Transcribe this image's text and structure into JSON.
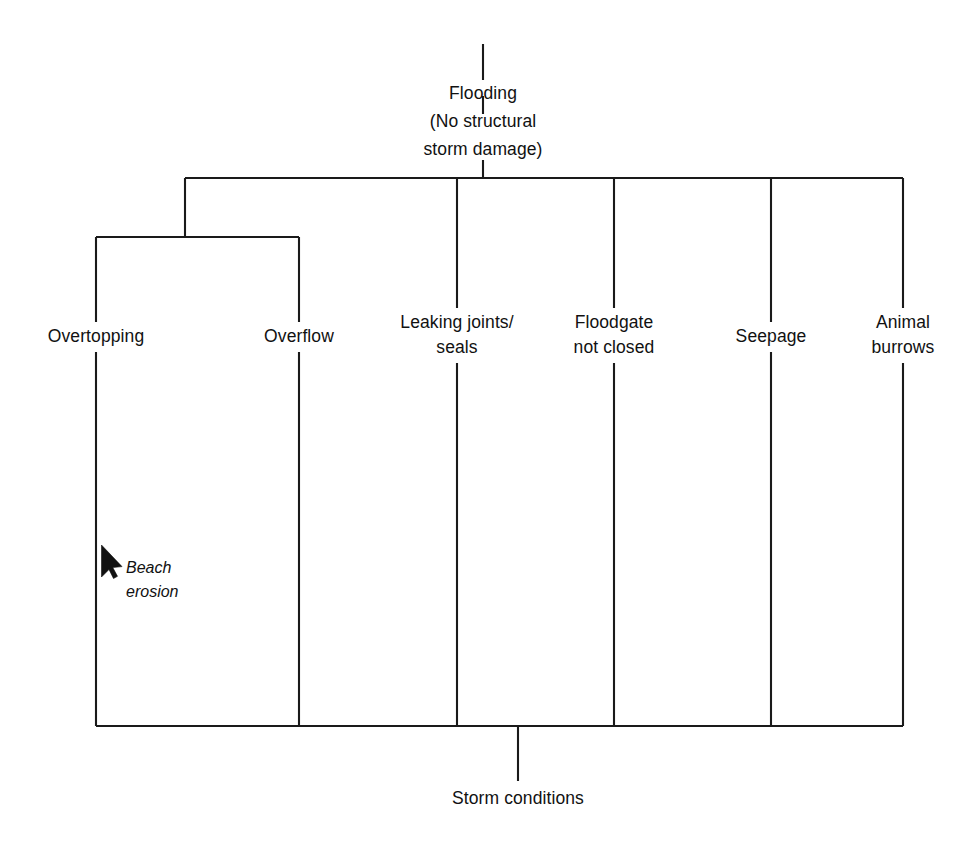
{
  "diagram": {
    "type": "fault-tree",
    "background_color": "#ffffff",
    "line_color": "#1a1a1a",
    "text_color": "#111111",
    "top_event": {
      "name": "flooding",
      "label": "Flooding\n(No structural\nstorm damage)"
    },
    "basic_event": {
      "name": "storm-conditions",
      "label": "Storm conditions"
    },
    "intermediate_events": [
      {
        "name": "overtopping",
        "label": "Overtopping"
      },
      {
        "name": "overflow",
        "label": "Overflow"
      },
      {
        "name": "leaking-joints-seals",
        "label": "Leaking joints/\nseals"
      },
      {
        "name": "floodgate-not-closed",
        "label": "Floodgate\nnot closed"
      },
      {
        "name": "seepage",
        "label": "Seepage"
      },
      {
        "name": "animal-burrows",
        "label": "Animal\nburrows"
      }
    ],
    "annotations": [
      {
        "name": "beach-erosion",
        "label": "Beach\nerosion",
        "style": "italic",
        "pointer": "arrow-cursor-icon"
      }
    ]
  }
}
